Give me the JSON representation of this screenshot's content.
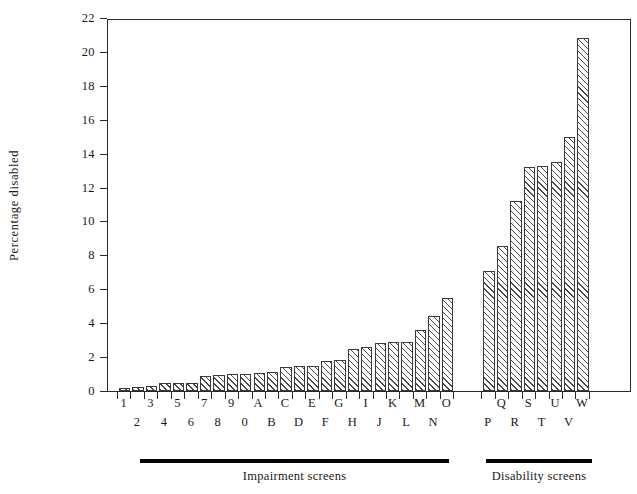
{
  "chart_data": {
    "type": "bar",
    "title": "",
    "xlabel": "",
    "ylabel": "Percentage disabled",
    "ylim": [
      0,
      22
    ],
    "ytick_values": [
      0,
      2,
      4,
      6,
      8,
      10,
      12,
      14,
      16,
      18,
      20,
      22
    ],
    "ytick_labels": [
      "0",
      "2",
      "4",
      "6",
      "8",
      "10",
      "12",
      "14",
      "16",
      "18",
      "20",
      "22"
    ],
    "grid": false,
    "legend_position": "below-axes",
    "categories": [
      "1",
      "2",
      "3",
      "4",
      "5",
      "6",
      "7",
      "8",
      "9",
      "0",
      "A",
      "B",
      "C",
      "D",
      "E",
      "F",
      "G",
      "H",
      "I",
      "J",
      "K",
      "L",
      "M",
      "N",
      "O",
      "P",
      "Q",
      "R",
      "S",
      "T",
      "U",
      "V",
      "W"
    ],
    "values": [
      0.2,
      0.25,
      0.3,
      0.45,
      0.45,
      0.5,
      0.9,
      0.95,
      1.0,
      1.0,
      1.05,
      1.1,
      1.4,
      1.5,
      1.45,
      1.75,
      1.8,
      2.45,
      2.6,
      2.85,
      2.9,
      2.9,
      3.6,
      4.45,
      5.5,
      7.1,
      8.55,
      11.2,
      13.2,
      13.3,
      13.5,
      15.0,
      20.85
    ],
    "groups": [
      {
        "label": "Impairment screens",
        "categories": [
          "1",
          "2",
          "3",
          "4",
          "5",
          "6",
          "7",
          "8",
          "9",
          "0",
          "A",
          "B",
          "C",
          "D",
          "E",
          "F",
          "G",
          "H",
          "I",
          "J",
          "K",
          "L",
          "M",
          "N",
          "O"
        ]
      },
      {
        "label": "Disability screens",
        "categories": [
          "P",
          "Q",
          "R",
          "S",
          "T",
          "U",
          "V",
          "W"
        ]
      }
    ]
  },
  "axis": {
    "y_title": "Percentage disabled"
  },
  "legend": {
    "impairment_label": "Impairment screens",
    "disability_label": "Disability screens"
  }
}
